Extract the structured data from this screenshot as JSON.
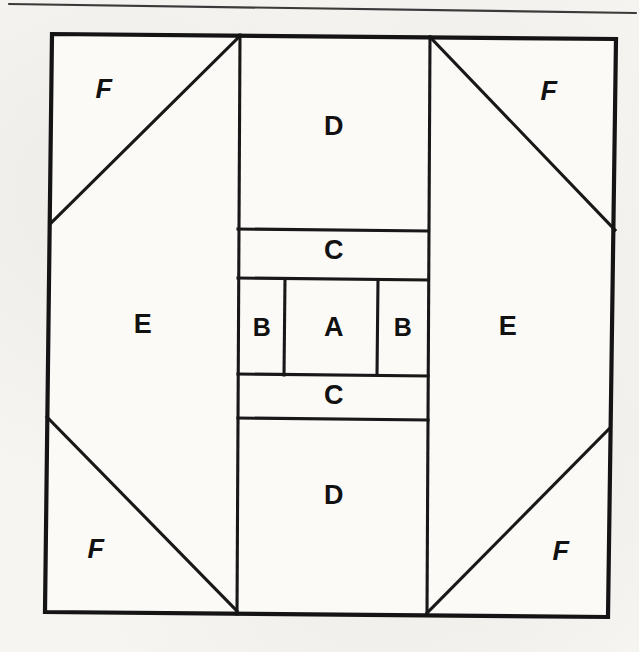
{
  "page": {
    "background_color": "#f7f5f2",
    "ink_color": "#141414",
    "width": 639,
    "height": 652
  },
  "rule": {
    "name": "top-horizontal-rule",
    "x1": 9,
    "y1": 4,
    "x2": 636,
    "y2": 13
  },
  "block": {
    "title": "pieced-block-diagram",
    "outline": {
      "top_left": [
        52,
        34
      ],
      "top_right": [
        616,
        39
      ],
      "bottom_right": [
        608,
        617
      ],
      "bottom_left": [
        45,
        612
      ]
    }
  },
  "patches": [
    {
      "id": "A",
      "label": "A",
      "shape": "square",
      "role": "center-square",
      "x": 285,
      "y": 279,
      "w": 93,
      "h": 95,
      "label_x": 334,
      "label_y": 329
    },
    {
      "id": "B-left",
      "label": "B",
      "shape": "rectangle",
      "role": "side-rectangle-left",
      "x": 239,
      "y": 279,
      "w": 46,
      "h": 95,
      "label_x": 262,
      "label_y": 329
    },
    {
      "id": "B-right",
      "label": "B",
      "shape": "rectangle",
      "role": "side-rectangle-right",
      "x": 378,
      "y": 279,
      "w": 48,
      "h": 95,
      "label_x": 403,
      "label_y": 329
    },
    {
      "id": "C-top",
      "label": "C",
      "shape": "rectangle",
      "role": "strip-above-center",
      "x": 238,
      "y": 229,
      "w": 190,
      "h": 49,
      "label_x": 334,
      "label_y": 252
    },
    {
      "id": "C-bottom",
      "label": "C",
      "shape": "rectangle",
      "role": "strip-below-center",
      "x": 238,
      "y": 375,
      "w": 190,
      "h": 44,
      "label_x": 334,
      "label_y": 397
    },
    {
      "id": "D-top",
      "label": "D",
      "shape": "rectangle",
      "role": "top-center-rectangle",
      "x": 240,
      "y": 35,
      "w": 190,
      "h": 194,
      "label_x": 334,
      "label_y": 128
    },
    {
      "id": "D-bottom",
      "label": "D",
      "shape": "rectangle",
      "role": "bottom-center-rectangle",
      "x": 237,
      "y": 419,
      "w": 190,
      "h": 195,
      "label_x": 334,
      "label_y": 497
    },
    {
      "id": "E-left",
      "label": "E",
      "shape": "triangle",
      "role": "side-setting-triangle-left",
      "points": "50,224 240,36 237,611 46,611 50,224",
      "label_x": 143,
      "label_y": 326
    },
    {
      "id": "E-right",
      "label": "E",
      "shape": "triangle",
      "role": "side-setting-triangle-right",
      "points": "430,37 615,230 610,615 427,613 430,37",
      "label_x": 508,
      "label_y": 328
    },
    {
      "id": "F-top-left",
      "label": "F",
      "shape": "corner-triangle",
      "role": "corner-triangle-top-left",
      "points": "52,34 240,36 50,224",
      "label_x": 104,
      "label_y": 91
    },
    {
      "id": "F-top-right",
      "label": "F",
      "shape": "corner-triangle",
      "role": "corner-triangle-top-right",
      "points": "430,37 616,39 615,230",
      "label_x": 549,
      "label_y": 93
    },
    {
      "id": "F-bottom-left",
      "label": "F",
      "shape": "corner-triangle",
      "role": "corner-triangle-bottom-left",
      "points": "47,417 237,611 46,611",
      "label_x": 96,
      "label_y": 551
    },
    {
      "id": "F-bottom-right",
      "label": "F",
      "shape": "corner-triangle",
      "role": "corner-triangle-bottom-right",
      "points": "610,428 610,615 427,613",
      "label_x": 561,
      "label_y": 553
    }
  ],
  "seams": [
    {
      "name": "seam-vertical-center-left",
      "x1": 240,
      "y1": 35,
      "x2": 237,
      "y2": 614
    },
    {
      "name": "seam-vertical-center-right",
      "x1": 430,
      "y1": 37,
      "x2": 427,
      "y2": 614
    },
    {
      "name": "seam-horizontal-c-top-upper",
      "x1": 238,
      "y1": 229,
      "x2": 428,
      "y2": 231
    },
    {
      "name": "seam-horizontal-c-top-lower",
      "x1": 238,
      "y1": 278,
      "x2": 428,
      "y2": 280
    },
    {
      "name": "seam-horizontal-c-bottom-upper",
      "x1": 238,
      "y1": 374,
      "x2": 428,
      "y2": 376
    },
    {
      "name": "seam-horizontal-c-bottom-lower",
      "x1": 238,
      "y1": 418,
      "x2": 428,
      "y2": 420
    },
    {
      "name": "seam-vertical-a-left",
      "x1": 285,
      "y1": 279,
      "x2": 284,
      "y2": 375
    },
    {
      "name": "seam-vertical-a-right",
      "x1": 378,
      "y1": 280,
      "x2": 377,
      "y2": 375
    },
    {
      "name": "diagonal-top-left",
      "x1": 240,
      "y1": 36,
      "x2": 50,
      "y2": 224
    },
    {
      "name": "diagonal-top-right",
      "x1": 430,
      "y1": 37,
      "x2": 615,
      "y2": 230
    },
    {
      "name": "diagonal-bottom-left",
      "x1": 47,
      "y1": 417,
      "x2": 237,
      "y2": 611
    },
    {
      "name": "diagonal-bottom-right",
      "x1": 610,
      "y1": 428,
      "x2": 427,
      "y2": 613
    }
  ]
}
